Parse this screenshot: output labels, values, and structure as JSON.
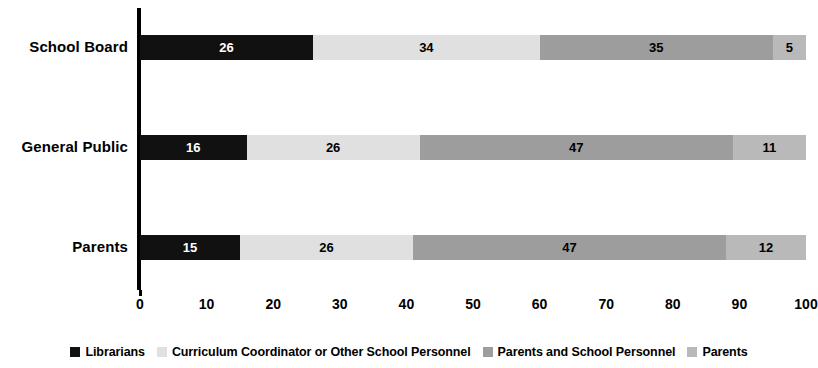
{
  "chart_data": {
    "type": "bar",
    "orientation": "horizontal",
    "stacked": true,
    "title": "",
    "subtitle": "",
    "xlabel": "",
    "ylabel": "",
    "xlim": [
      0,
      100
    ],
    "xticks": [
      0,
      10,
      20,
      30,
      40,
      50,
      60,
      70,
      80,
      90,
      100
    ],
    "xtick_labels": [
      "0",
      "10",
      "20",
      "30",
      "40",
      "50",
      "60",
      "70",
      "80",
      "90",
      "100"
    ],
    "grid": false,
    "legend_position": "bottom",
    "categories": [
      "School Board",
      "General Public",
      "Parents"
    ],
    "series": [
      {
        "name": "Librarians",
        "color": "#111111",
        "label_color": "#ffffff",
        "values": [
          26,
          16,
          15
        ]
      },
      {
        "name": "Curriculum Coordinator or Other School Personnel",
        "color": "#e0e0e0",
        "label_color": "#000000",
        "values": [
          34,
          26,
          26
        ]
      },
      {
        "name": "Parents and School Personnel",
        "color": "#9d9d9d",
        "label_color": "#000000",
        "values": [
          35,
          47,
          47
        ]
      },
      {
        "name": "Parents",
        "color": "#b9b9b9",
        "label_color": "#000000",
        "values": [
          5,
          11,
          12
        ]
      }
    ],
    "bars": [
      {
        "category": "School Board",
        "segments": [
          {
            "series": "Librarians",
            "value": 26,
            "label": "26"
          },
          {
            "series": "Curriculum Coordinator or Other School Personnel",
            "value": 34,
            "label": "34"
          },
          {
            "series": "Parents and School Personnel",
            "value": 35,
            "label": "35"
          },
          {
            "series": "Parents",
            "value": 5,
            "label": "5"
          }
        ]
      },
      {
        "category": "General Public",
        "segments": [
          {
            "series": "Librarians",
            "value": 16,
            "label": "16"
          },
          {
            "series": "Curriculum Coordinator or Other School Personnel",
            "value": 26,
            "label": "26"
          },
          {
            "series": "Parents and School Personnel",
            "value": 47,
            "label": "47"
          },
          {
            "series": "Parents",
            "value": 11,
            "label": "11"
          }
        ]
      },
      {
        "category": "Parents",
        "segments": [
          {
            "series": "Librarians",
            "value": 15,
            "label": "15"
          },
          {
            "series": "Curriculum Coordinator or Other School Personnel",
            "value": 26,
            "label": "26"
          },
          {
            "series": "Parents and School Personnel",
            "value": 47,
            "label": "47"
          },
          {
            "series": "Parents",
            "value": 12,
            "label": "12"
          }
        ]
      }
    ]
  },
  "axis": {
    "line_color": "#000000"
  },
  "legend": {
    "items": [
      {
        "label": "Librarians",
        "color": "#111111"
      },
      {
        "label": "Curriculum Coordinator or Other School Personnel",
        "color": "#e0e0e0"
      },
      {
        "label": "Parents and School Personnel",
        "color": "#9d9d9d"
      },
      {
        "label": "Parents",
        "color": "#b9b9b9"
      }
    ]
  }
}
